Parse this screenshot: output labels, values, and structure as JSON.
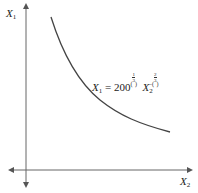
{
  "diagram": {
    "type": "isoquant",
    "y_axis_label": {
      "var": "X",
      "sub": "1"
    },
    "x_axis_label": {
      "var": "X",
      "sub": "2"
    },
    "equation": {
      "lhs_var": "X",
      "lhs_sub": "1",
      "equals": "=",
      "coefficient": "200",
      "coef_exp_open": "(",
      "coef_exp_num": "1",
      "coef_exp_den": "3",
      "coef_exp_close": ")",
      "rhs_var": "X",
      "rhs_sub": "2",
      "rhs_exp_sign": "−",
      "rhs_exp_open": "(",
      "rhs_exp_num": "2",
      "rhs_exp_den": "3",
      "rhs_exp_close": ")"
    },
    "colors": {
      "axis": "#555555",
      "curve": "#444444",
      "text": "#222222"
    }
  }
}
